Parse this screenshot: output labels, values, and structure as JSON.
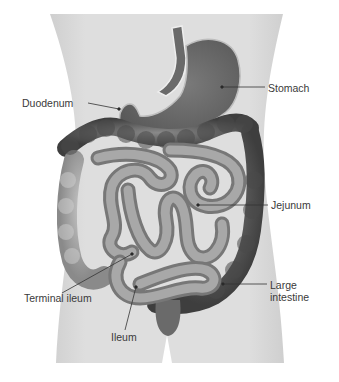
{
  "diagram": {
    "colors": {
      "background": "#ffffff",
      "torso": "#dcdcdc",
      "stomach": "#6e6e6e",
      "small_intestine": "#8c8c8c",
      "large_intestine": "#5a5a5a",
      "leader_line": "#333333",
      "label_text": "#3a3a3a"
    },
    "labels": {
      "duodenum": "Duodenum",
      "stomach": "Stomach",
      "jejunum": "Jejunum",
      "large_intestine_line1": "Large",
      "large_intestine_line2": "intestine",
      "terminal_ileum": "Terminal ileum",
      "ileum": "Ileum"
    }
  }
}
